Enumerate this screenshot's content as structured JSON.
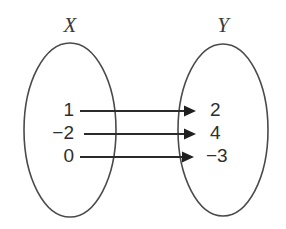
{
  "diagram": {
    "type": "mapping-diagram",
    "width": 286,
    "height": 229,
    "background_color": "#ffffff",
    "stroke_color": "#4a4a4a",
    "arrow_color": "#2b2b2b",
    "text_color": "#2e2e2e",
    "domain": {
      "label": "X",
      "label_x": 70,
      "label_y": 32,
      "oval": {
        "cx": 70,
        "cy": 130,
        "rx": 46,
        "ry": 87
      },
      "elements": [
        {
          "value": "1",
          "x": 74,
          "y": 111
        },
        {
          "value": "−2",
          "x": 74,
          "y": 134
        },
        {
          "value": "0",
          "x": 74,
          "y": 157
        }
      ]
    },
    "codomain": {
      "label": "Y",
      "label_x": 223,
      "label_y": 32,
      "oval": {
        "cx": 223,
        "cy": 130,
        "rx": 45,
        "ry": 86
      },
      "elements": [
        {
          "value": "2",
          "x": 210,
          "y": 111
        },
        {
          "value": "4",
          "x": 210,
          "y": 134
        },
        {
          "value": "−3",
          "x": 206,
          "y": 157
        }
      ]
    },
    "arrows": [
      {
        "from": "1",
        "to": "2",
        "x1": 80,
        "x2": 196,
        "y": 111
      },
      {
        "from": "−2",
        "to": "4",
        "x1": 84,
        "x2": 196,
        "y": 134
      },
      {
        "from": "0",
        "to": "−3",
        "x1": 80,
        "x2": 194,
        "y": 157
      }
    ]
  }
}
